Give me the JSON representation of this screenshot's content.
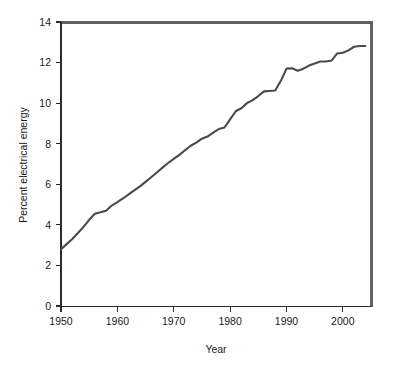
{
  "chart_data": {
    "type": "line",
    "title": "",
    "xlabel": "Year",
    "ylabel": "Percent electrical energy",
    "xlim": [
      1950,
      2005
    ],
    "ylim": [
      0,
      14
    ],
    "xticks": [
      1950,
      1960,
      1970,
      1980,
      1990,
      2000
    ],
    "yticks": [
      0,
      2,
      4,
      6,
      8,
      10,
      12,
      14
    ],
    "xtick_labels": [
      "1950",
      "1960",
      "1970",
      "1980",
      "1990",
      "2000"
    ],
    "ytick_labels": [
      "0",
      "2",
      "4",
      "6",
      "8",
      "10",
      "12",
      "14"
    ],
    "grid": false,
    "legend": false,
    "legend_position": "none",
    "line_color": "#4a4a4a",
    "series": [
      {
        "name": "Percent electrical energy",
        "x": [
          1950,
          1951,
          1952,
          1953,
          1954,
          1955,
          1956,
          1957,
          1958,
          1959,
          1960,
          1961,
          1962,
          1963,
          1964,
          1965,
          1966,
          1967,
          1968,
          1969,
          1970,
          1971,
          1972,
          1973,
          1974,
          1975,
          1976,
          1977,
          1978,
          1979,
          1980,
          1981,
          1982,
          1983,
          1984,
          1985,
          1986,
          1987,
          1988,
          1989,
          1990,
          1991,
          1992,
          1993,
          1994,
          1995,
          1996,
          1997,
          1998,
          1999,
          2000,
          2001,
          2002,
          2003,
          2004
        ],
        "values": [
          2.8,
          3.05,
          3.3,
          3.6,
          3.9,
          4.25,
          4.55,
          4.62,
          4.7,
          4.95,
          5.12,
          5.3,
          5.5,
          5.7,
          5.9,
          6.12,
          6.35,
          6.58,
          6.82,
          7.05,
          7.25,
          7.45,
          7.68,
          7.9,
          8.05,
          8.25,
          8.35,
          8.55,
          8.72,
          8.8,
          9.2,
          9.6,
          9.75,
          10.0,
          10.15,
          10.35,
          10.58,
          10.6,
          10.62,
          11.1,
          11.7,
          11.72,
          11.6,
          11.7,
          11.85,
          11.95,
          12.05,
          12.05,
          12.1,
          12.45,
          12.48,
          12.6,
          12.78,
          12.82,
          12.82
        ]
      }
    ]
  },
  "axes": {
    "x_title": "Year",
    "y_title": "Percent electrical energy"
  }
}
